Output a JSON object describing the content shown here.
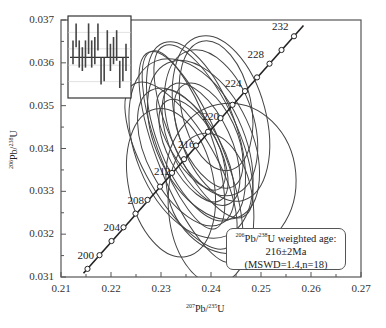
{
  "chart_data": {
    "type": "scatter",
    "subtype": "U-Pb concordia diagram with error ellipses and weighted-mean inset",
    "xlabel": "207Pb/235U",
    "ylabel": "206Pb/238U",
    "xlim": [
      0.21,
      0.27
    ],
    "ylim": [
      0.031,
      0.037
    ],
    "x_ticks": [
      "0.21",
      "0.22",
      "0.23",
      "0.24",
      "0.25",
      "0.26",
      "0.27"
    ],
    "y_ticks": [
      "0.031",
      "0.032",
      "0.033",
      "0.034",
      "0.035",
      "0.036",
      "0.037"
    ],
    "grid": false,
    "concordia_age_labels": [
      "200",
      "204",
      "208",
      "212",
      "216",
      "220",
      "224",
      "228",
      "232"
    ],
    "concordia_points": [
      {
        "age": 200,
        "x": 0.2177,
        "y": 0.03151
      },
      {
        "age": 202,
        "x": 0.2201,
        "y": 0.03184
      },
      {
        "age": 204,
        "x": 0.2225,
        "y": 0.03216
      },
      {
        "age": 206,
        "x": 0.2249,
        "y": 0.03248
      },
      {
        "age": 208,
        "x": 0.2273,
        "y": 0.0328
      },
      {
        "age": 210,
        "x": 0.2298,
        "y": 0.03311
      },
      {
        "age": 212,
        "x": 0.2322,
        "y": 0.03343
      },
      {
        "age": 214,
        "x": 0.2346,
        "y": 0.03375
      },
      {
        "age": 216,
        "x": 0.237,
        "y": 0.03407
      },
      {
        "age": 218,
        "x": 0.2394,
        "y": 0.03439
      },
      {
        "age": 220,
        "x": 0.2419,
        "y": 0.03471
      },
      {
        "age": 222,
        "x": 0.2443,
        "y": 0.03502
      },
      {
        "age": 224,
        "x": 0.2468,
        "y": 0.03534
      },
      {
        "age": 226,
        "x": 0.2492,
        "y": 0.03566
      },
      {
        "age": 228,
        "x": 0.2517,
        "y": 0.03598
      },
      {
        "age": 230,
        "x": 0.2541,
        "y": 0.0363
      },
      {
        "age": 232,
        "x": 0.2566,
        "y": 0.03662
      }
    ],
    "ellipses_approx": [
      {
        "cx": 0.236,
        "cy": 0.034,
        "rx": 0.011,
        "ry": 0.001,
        "rot": -22
      },
      {
        "cx": 0.2385,
        "cy": 0.0342,
        "rx": 0.0095,
        "ry": 0.0009,
        "rot": -25
      },
      {
        "cx": 0.237,
        "cy": 0.0344,
        "rx": 0.008,
        "ry": 0.001,
        "rot": -20
      },
      {
        "cx": 0.235,
        "cy": 0.0338,
        "rx": 0.0075,
        "ry": 0.0008,
        "rot": -28
      },
      {
        "cx": 0.24,
        "cy": 0.0346,
        "rx": 0.0085,
        "ry": 0.0008,
        "rot": -18
      },
      {
        "cx": 0.234,
        "cy": 0.0336,
        "rx": 0.007,
        "ry": 0.001,
        "rot": -30
      },
      {
        "cx": 0.238,
        "cy": 0.0341,
        "rx": 0.006,
        "ry": 0.0007,
        "rot": -25
      },
      {
        "cx": 0.2365,
        "cy": 0.03395,
        "rx": 0.005,
        "ry": 0.0006,
        "rot": -28
      },
      {
        "cx": 0.2395,
        "cy": 0.0343,
        "rx": 0.0055,
        "ry": 0.0006,
        "rot": -25
      },
      {
        "cx": 0.236,
        "cy": 0.0342,
        "rx": 0.0045,
        "ry": 0.0006,
        "rot": -30
      },
      {
        "cx": 0.241,
        "cy": 0.035,
        "rx": 0.007,
        "ry": 0.0007,
        "rot": -12
      },
      {
        "cx": 0.242,
        "cy": 0.0347,
        "rx": 0.009,
        "ry": 0.0009,
        "rot": -15
      },
      {
        "cx": 0.232,
        "cy": 0.0332,
        "rx": 0.0085,
        "ry": 0.0008,
        "rot": -12
      },
      {
        "cx": 0.244,
        "cy": 0.0333,
        "rx": 0.013,
        "ry": 0.0008,
        "rot": -5
      },
      {
        "cx": 0.24,
        "cy": 0.0326,
        "rx": 0.0085,
        "ry": 0.0008,
        "rot": -5
      },
      {
        "cx": 0.236,
        "cy": 0.0338,
        "rx": 0.0065,
        "ry": 0.0012,
        "rot": -22
      },
      {
        "cx": 0.2385,
        "cy": 0.0344,
        "rx": 0.0065,
        "ry": 0.001,
        "rot": -25
      },
      {
        "cx": 0.2345,
        "cy": 0.0342,
        "rx": 0.0055,
        "ry": 0.001,
        "rot": -20
      }
    ],
    "annotation": {
      "line1_prefix_sup1": "206",
      "line1_mid": "Pb/",
      "line1_sup2": "238",
      "line1_suffix": "U weighted age:",
      "line2": "216±2Ma",
      "line3": "(MSWD=1.4,n=18)"
    },
    "inset": {
      "type": "weighted-mean bar plot",
      "n_bars": 18,
      "mean_line": 0.5,
      "bars": [
        [
          0.35,
          0.7
        ],
        [
          0.6,
          0.95
        ],
        [
          0.3,
          0.7
        ],
        [
          0.25,
          0.6
        ],
        [
          0.3,
          0.7
        ],
        [
          0.5,
          0.95
        ],
        [
          0.3,
          0.7
        ],
        [
          0.35,
          0.75
        ],
        [
          0.55,
          0.95
        ],
        [
          0.05,
          0.45
        ],
        [
          0.1,
          0.45
        ],
        [
          0.45,
          0.85
        ],
        [
          0.25,
          0.65
        ],
        [
          0.35,
          0.75
        ],
        [
          0.4,
          0.85
        ],
        [
          0.0,
          0.4
        ],
        [
          0.1,
          0.45
        ],
        [
          0.25,
          0.65
        ]
      ]
    }
  },
  "axes": {
    "x_title_sup": "207",
    "x_title_mid": "Pb/",
    "x_title_sup2": "235",
    "x_title_end": "U",
    "y_title_sup": "206",
    "y_title_mid": "Pb/",
    "y_title_sup2": "238",
    "y_title_end": "U"
  }
}
